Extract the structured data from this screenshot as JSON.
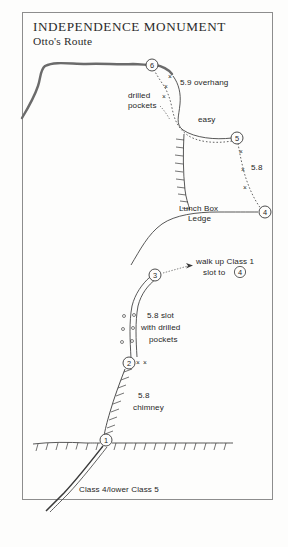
{
  "title": {
    "main": "INDEPENDENCE MONUMENT",
    "sub": "Otto's Route"
  },
  "colors": {
    "ink": "#1f1f1f",
    "summit_ridge": "#6b6b6b",
    "page_bg": "#fdfdfc",
    "border": "#8d8d8d"
  },
  "annotations": {
    "overhang": "5.9 overhang",
    "drilled_pockets_1": "drilled",
    "drilled_pockets_2": "pockets",
    "easy": "easy",
    "pitch_5_8": "5.8",
    "lunch_box_1": "Lunch Box",
    "lunch_box_2": "Ledge",
    "walk_up_1": "walk up Class 1",
    "walk_up_2a": "slot to",
    "walk_up_2b": "4",
    "slot_1": "5.8 slot",
    "slot_2": "with drilled",
    "slot_3": "pockets",
    "chimney_1": "5.8",
    "chimney_2": "chimney",
    "approach": "Class 4/lower Class 5"
  },
  "stations": [
    {
      "id": "1",
      "label": "1",
      "cx": 106,
      "cy": 440
    },
    {
      "id": "2",
      "label": "2",
      "cx": 129,
      "cy": 363
    },
    {
      "id": "3",
      "label": "3",
      "cx": 155,
      "cy": 275
    },
    {
      "id": "4",
      "label": "4",
      "cx": 265,
      "cy": 212
    },
    {
      "id": "5",
      "label": "5",
      "cx": 237,
      "cy": 138
    },
    {
      "id": "6",
      "label": "6",
      "cx": 152,
      "cy": 65
    }
  ],
  "bolts": {
    "overhang": [
      {
        "x": 170,
        "y": 77
      },
      {
        "x": 166,
        "y": 87
      },
      {
        "x": 164,
        "y": 97
      }
    ],
    "pitch_5_8": [
      {
        "x": 241,
        "y": 152
      },
      {
        "x": 243,
        "y": 170
      },
      {
        "x": 245,
        "y": 188
      }
    ],
    "station2": [
      {
        "x": 137,
        "y": 362
      },
      {
        "x": 144,
        "y": 362
      }
    ]
  },
  "pocket_marks": [
    {
      "x": 122,
      "y": 315
    },
    {
      "x": 134,
      "y": 315
    },
    {
      "x": 121,
      "y": 327
    },
    {
      "x": 133,
      "y": 327
    },
    {
      "x": 120,
      "y": 339
    },
    {
      "x": 132,
      "y": 339
    }
  ],
  "icons": {
    "belay_station": "circled-number-icon",
    "bolt": "x-bolt-icon",
    "pocket": "small-circle-pocket-icon",
    "arrow": "pointer-arrow-icon"
  }
}
